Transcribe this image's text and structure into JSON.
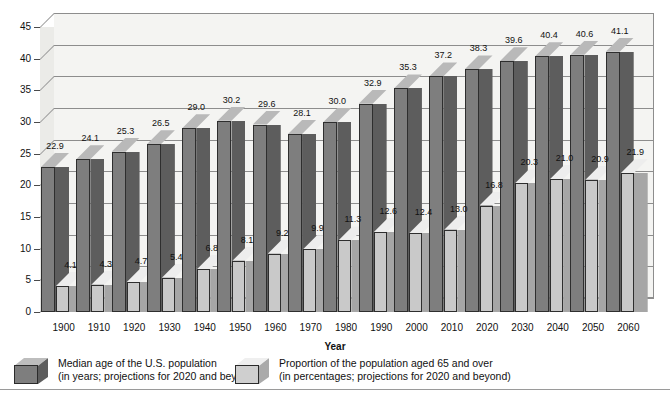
{
  "chart_data": {
    "type": "bar",
    "title": "",
    "subtitle": "",
    "xlabel": "Year",
    "ylabel": "",
    "ylim": [
      0,
      45
    ],
    "ytick_step": 5,
    "yticks": [
      "0",
      "5",
      "10",
      "15",
      "20",
      "25",
      "30",
      "35",
      "40",
      "45"
    ],
    "grid": true,
    "legend_position": "bottom",
    "style": "3d-isometric-column",
    "categories": [
      "1900",
      "1910",
      "1920",
      "1930",
      "1940",
      "1950",
      "1960",
      "1970",
      "1980",
      "1990",
      "2000",
      "2010",
      "2020",
      "2030",
      "2040",
      "2050",
      "2060"
    ],
    "series": [
      {
        "name": "Median age of the U.S. population",
        "unit": "years",
        "color": "#7e7e7e",
        "values": [
          22.9,
          24.1,
          25.3,
          26.5,
          29.0,
          30.2,
          29.6,
          28.1,
          30.0,
          32.9,
          35.3,
          37.2,
          38.3,
          39.6,
          40.4,
          40.6,
          41.1
        ],
        "labels": [
          "22.9",
          "24.1",
          "25.3",
          "26.5",
          "29.0",
          "30.2",
          "29.6",
          "28.1",
          "30.0",
          "32.9",
          "35.3",
          "37.2",
          "38.3",
          "39.6",
          "40.4",
          "40.6",
          "41.1"
        ]
      },
      {
        "name": "Proportion of the population aged 65 and over",
        "unit": "percent",
        "color": "#c9c9c9",
        "values": [
          4.1,
          4.3,
          4.7,
          5.4,
          6.8,
          8.1,
          9.2,
          9.9,
          11.3,
          12.6,
          12.4,
          13.0,
          16.8,
          20.3,
          21.0,
          20.9,
          21.9
        ],
        "labels": [
          "4.1",
          "4.3",
          "4.7",
          "5.4",
          "6.8",
          "8.1",
          "9.2",
          "9.9",
          "11.3",
          "12.6",
          "12.4",
          "13.0",
          "16.8",
          "20.3",
          "21.0",
          "20.9",
          "21.9"
        ]
      }
    ],
    "annotations": {
      "projection_note": "projections for 2020 and beyond"
    }
  },
  "axis": {
    "x_title": "Year"
  },
  "legend": {
    "items": [
      {
        "icon": "cube-dark-icon",
        "line1": "Median age of the U.S. population",
        "line2": "(in years; projections for 2020 and beyond)"
      },
      {
        "icon": "cube-light-icon",
        "line1": "Proportion of the population aged 65 and over",
        "line2": "(in percentages; projections for 2020 and beyond)"
      }
    ]
  }
}
